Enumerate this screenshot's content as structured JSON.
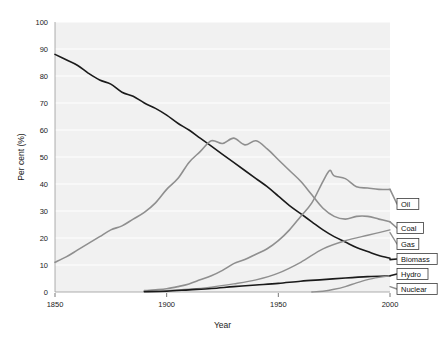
{
  "chart_data": {
    "type": "line",
    "title": "",
    "xlabel": "Year",
    "ylabel": "Per cent (%)",
    "xlim": [
      1850,
      2000
    ],
    "ylim": [
      0,
      100
    ],
    "xticks": [
      1850,
      1900,
      1950,
      2000
    ],
    "yticks": [
      0,
      10,
      20,
      30,
      40,
      50,
      60,
      70,
      80,
      90,
      100
    ],
    "grid": true,
    "legend_position": "right-inline-labels",
    "series": [
      {
        "name": "Biomass",
        "color": "#1a1a1a",
        "width": 1.6,
        "label_y_pct": 12,
        "x": [
          1850,
          1855,
          1860,
          1865,
          1870,
          1875,
          1880,
          1885,
          1890,
          1895,
          1900,
          1905,
          1910,
          1915,
          1920,
          1925,
          1930,
          1935,
          1940,
          1945,
          1950,
          1955,
          1960,
          1965,
          1970,
          1975,
          1980,
          1985,
          1990,
          1995,
          2000
        ],
        "values": [
          88,
          86,
          84,
          81,
          78.5,
          77,
          74,
          72.5,
          70,
          68,
          65.5,
          62.5,
          60,
          57,
          54,
          51,
          48,
          45,
          42,
          39,
          35.5,
          32,
          29,
          26,
          23,
          20.5,
          18.5,
          16.5,
          15,
          13.5,
          12.5
        ]
      },
      {
        "name": "Coal",
        "color": "#8f8f8f",
        "width": 1.6,
        "label_y_pct": 26,
        "x": [
          1850,
          1855,
          1860,
          1865,
          1870,
          1875,
          1880,
          1885,
          1890,
          1895,
          1900,
          1905,
          1910,
          1915,
          1920,
          1925,
          1930,
          1935,
          1940,
          1945,
          1950,
          1955,
          1960,
          1965,
          1970,
          1975,
          1980,
          1985,
          1990,
          1995,
          2000
        ],
        "values": [
          11,
          13,
          15.5,
          18,
          20.5,
          23,
          24.5,
          27,
          29.5,
          33,
          38,
          42,
          48,
          52,
          56,
          55,
          57,
          54.5,
          56,
          53,
          49,
          45,
          41,
          36,
          31,
          28,
          27,
          28,
          28,
          27,
          26
        ]
      },
      {
        "name": "Oil",
        "color": "#8f8f8f",
        "width": 1.6,
        "label_y_pct": 38,
        "x": [
          1890,
          1895,
          1900,
          1905,
          1910,
          1915,
          1920,
          1925,
          1930,
          1935,
          1940,
          1945,
          1950,
          1955,
          1960,
          1965,
          1970,
          1973,
          1975,
          1980,
          1985,
          1990,
          1995,
          2000
        ],
        "values": [
          0.5,
          0.8,
          1.2,
          2,
          3,
          4.5,
          6,
          8,
          10.5,
          12,
          14,
          16,
          19,
          23,
          28,
          33,
          41,
          45,
          43,
          42,
          39,
          38.5,
          38,
          38
        ]
      },
      {
        "name": "Gas",
        "color": "#8f8f8f",
        "width": 1.4,
        "label_y_pct": 22,
        "x": [
          1890,
          1900,
          1910,
          1920,
          1930,
          1940,
          1950,
          1960,
          1970,
          1980,
          1990,
          1995,
          2000
        ],
        "values": [
          0.2,
          0.5,
          1,
          1.8,
          3,
          4.5,
          7,
          11,
          16,
          19,
          21,
          22,
          23
        ]
      },
      {
        "name": "Hydro",
        "color": "#1a1a1a",
        "width": 1.6,
        "label_y_pct": 6,
        "x": [
          1890,
          1900,
          1910,
          1920,
          1930,
          1940,
          1950,
          1960,
          1970,
          1980,
          1990,
          2000
        ],
        "values": [
          0.1,
          0.3,
          0.8,
          1.3,
          2,
          2.6,
          3.2,
          4,
          4.6,
          5.2,
          5.7,
          6
        ]
      },
      {
        "name": "Nuclear",
        "color": "#8f8f8f",
        "width": 1.4,
        "label_y_pct": 2,
        "x": [
          1965,
          1970,
          1975,
          1980,
          1985,
          1990,
          1995,
          2000
        ],
        "values": [
          0,
          0.3,
          1,
          2,
          3.4,
          4.6,
          5.4,
          6
        ]
      }
    ]
  },
  "legend": {
    "items": [
      {
        "label": "Oil",
        "y": 204
      },
      {
        "label": "Coal",
        "y": 228
      },
      {
        "label": "Gas",
        "y": 244
      },
      {
        "label": "Biomass",
        "y": 259
      },
      {
        "label": "Hydro",
        "y": 274
      },
      {
        "label": "Nuclear",
        "y": 289
      }
    ]
  },
  "axes": {
    "x_tick_labels": [
      "1850",
      "1900",
      "1950",
      "2000"
    ],
    "y_tick_labels": [
      "0",
      "10",
      "20",
      "30",
      "40",
      "50",
      "60",
      "70",
      "80",
      "90",
      "100"
    ],
    "x_axis_title": "Year",
    "y_axis_title": "Per cent (%)"
  }
}
